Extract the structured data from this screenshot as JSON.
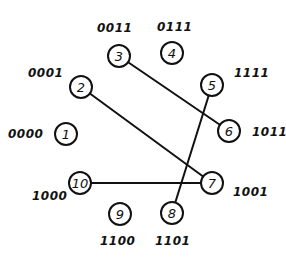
{
  "diagram": {
    "type": "circular-graph",
    "stroke_color": "#111111",
    "background_color": "#ffffff",
    "node_radius": 11,
    "nodes": [
      {
        "id": "1",
        "label": "1",
        "code": "0000",
        "x": 66,
        "y": 134,
        "code_x": 8,
        "code_y": 134,
        "code_anchor": "start"
      },
      {
        "id": "2",
        "label": "2",
        "code": "0001",
        "x": 81,
        "y": 87,
        "code_x": 28,
        "code_y": 73,
        "code_anchor": "start"
      },
      {
        "id": "3",
        "label": "3",
        "code": "0011",
        "x": 119,
        "y": 56,
        "code_x": 97,
        "code_y": 28,
        "code_anchor": "start"
      },
      {
        "id": "4",
        "label": "4",
        "code": "0111",
        "x": 172,
        "y": 53,
        "code_x": 157,
        "code_y": 27,
        "code_anchor": "start"
      },
      {
        "id": "5",
        "label": "5",
        "code": "1111",
        "x": 212,
        "y": 85,
        "code_x": 234,
        "code_y": 73,
        "code_anchor": "start"
      },
      {
        "id": "6",
        "label": "6",
        "code": "1011",
        "x": 229,
        "y": 131,
        "code_x": 252,
        "code_y": 132,
        "code_anchor": "start"
      },
      {
        "id": "7",
        "label": "7",
        "code": "1001",
        "x": 212,
        "y": 183,
        "code_x": 233,
        "code_y": 192,
        "code_anchor": "start"
      },
      {
        "id": "8",
        "label": "8",
        "code": "1101",
        "x": 172,
        "y": 213,
        "code_x": 155,
        "code_y": 241,
        "code_anchor": "start"
      },
      {
        "id": "9",
        "label": "9",
        "code": "1100",
        "x": 120,
        "y": 214,
        "code_x": 100,
        "code_y": 241,
        "code_anchor": "start"
      },
      {
        "id": "10",
        "label": "10",
        "code": "1000",
        "x": 80,
        "y": 183,
        "code_x": 32,
        "code_y": 196,
        "code_anchor": "start"
      }
    ],
    "edges": [
      {
        "from": "3",
        "to": "6"
      },
      {
        "from": "2",
        "to": "7"
      },
      {
        "from": "5",
        "to": "8"
      },
      {
        "from": "10",
        "to": "7"
      }
    ]
  }
}
